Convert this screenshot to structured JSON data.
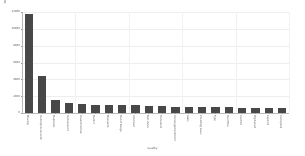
{
  "chart_data": {
    "type": "bar",
    "title": "",
    "subtitle": "",
    "xlabel": "quality",
    "ylabel": "Total Number of Occurrences",
    "categories": [
      "Missing",
      "Incomplete Record",
      "Duplicate",
      "Inconsistent",
      "Invalid Format",
      "Outlier",
      "Mismatch",
      "Out of Range",
      "Unknown",
      "Null Value",
      "Truncated",
      "Uncategorized Error",
      "Stale",
      "Encoding Issue",
      "Typo",
      "Overflow",
      "Conflict",
      "Orphaned",
      "Expired",
      "Corrupted"
    ],
    "values": [
      11800,
      4350,
      1580,
      1160,
      1020,
      960,
      940,
      935,
      930,
      820,
      800,
      700,
      690,
      685,
      680,
      675,
      640,
      600,
      560,
      540
    ],
    "ylim": [
      0,
      12000
    ],
    "yticks": [
      0,
      2000,
      4000,
      6000,
      8000,
      10000,
      12000
    ],
    "ytick_labels": [
      "0",
      "2000",
      "4000",
      "6000",
      "8000",
      "10000",
      "12000"
    ],
    "grid": true,
    "legend": false,
    "legend_position": "none",
    "bar_color": "#484848",
    "background_color": "#ffffff",
    "grid_color": "#ededf2",
    "axis_color": "#b8b8b8"
  }
}
